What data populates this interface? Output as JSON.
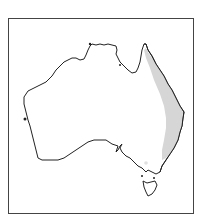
{
  "map": {
    "region": "Australia",
    "type": "species distribution map",
    "frame_color": "#444444",
    "land_fill": "#ffffff",
    "coast_color": "#222222",
    "range_fill": "#d6d6d6",
    "range_description": "Eastern coastal Queensland and New South Wales",
    "outlier_record": "Victoria (single point)"
  }
}
